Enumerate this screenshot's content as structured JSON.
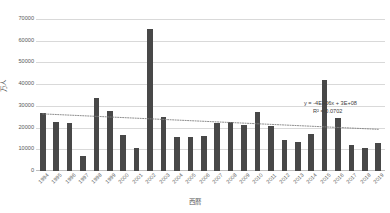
{
  "chart_data": {
    "type": "bar",
    "title": "",
    "subtitle": "",
    "xlabel": "西暦",
    "ylabel": "万人",
    "ylim": [
      0,
      70000
    ],
    "ytick_step": 10000,
    "yticks": [
      "70000",
      "60000",
      "50000",
      "40000",
      "30000",
      "20000",
      "10000",
      "0"
    ],
    "grid": true,
    "legend": "none",
    "categories": [
      "1994",
      "1995",
      "1996",
      "1997",
      "1998",
      "1999",
      "2000",
      "2001",
      "2002",
      "2003",
      "2004",
      "2005",
      "2006",
      "2007",
      "2008",
      "2009",
      "2010",
      "2011",
      "2012",
      "2013",
      "2014",
      "2015",
      "2016",
      "2017",
      "2018",
      "2019"
    ],
    "values": [
      26800,
      22800,
      22000,
      7000,
      33500,
      27800,
      16500,
      10500,
      65500,
      24800,
      15800,
      15500,
      16200,
      22000,
      22800,
      21000,
      27000,
      20800,
      14500,
      13200,
      17200,
      42000,
      24200,
      11800,
      10500,
      12800
    ],
    "series": [
      {
        "name": "万人",
        "color": "#484848",
        "values": [
          26800,
          22800,
          22000,
          7000,
          33500,
          27800,
          16500,
          10500,
          65500,
          24800,
          15800,
          15500,
          16200,
          22000,
          22800,
          21000,
          27000,
          20800,
          14500,
          13200,
          17200,
          42000,
          24200,
          11800,
          10500,
          12800
        ]
      }
    ],
    "trendline": {
      "type": "linear",
      "style": "dotted",
      "color": "#808080",
      "equation": "y = -4E+06x + 3E+08",
      "r_squared_label": "R² = 0.0702",
      "r_squared": 0.0702,
      "start_value": 26300,
      "end_value": 19200
    },
    "annotations": [
      {
        "name": "trendline-equation",
        "text": "y = -4E+06x + 3E+08"
      },
      {
        "name": "trendline-r-squared",
        "text": "R² = 0.0702"
      }
    ],
    "colors": {
      "bar": "#484848",
      "gridline": "#d9d9d9",
      "axis": "#bfbfbf",
      "text": "#595959",
      "trendline": "#808080"
    }
  }
}
